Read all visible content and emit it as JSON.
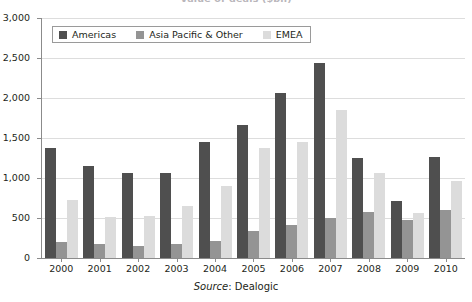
{
  "title": "Value of deals ($bn)",
  "legend": {
    "position": "top-left-inside",
    "items": [
      {
        "label": "Americas",
        "color": "#4f4f4f"
      },
      {
        "label": "Asia Pacific & Other",
        "color": "#949494"
      },
      {
        "label": "EMEA",
        "color": "#dcdcdc"
      }
    ]
  },
  "source": {
    "label": "Source",
    "separator": ":",
    "value": "Dealogic",
    "full": "Source: Dealogic"
  },
  "yaxis": {
    "ticks": [
      "0",
      "500",
      "1,000",
      "1,500",
      "2,000",
      "2,500",
      "3,000"
    ],
    "min": 0,
    "max": 3000,
    "step": 500
  },
  "chart_data": {
    "type": "bar",
    "title": "Value of deals ($bn)",
    "xlabel": "",
    "ylabel": "",
    "ylim": [
      0,
      3000
    ],
    "ytick_step": 500,
    "grid": true,
    "legend_position": "upper left",
    "categories": [
      "2000",
      "2001",
      "2002",
      "2003",
      "2004",
      "2005",
      "2006",
      "2007",
      "2008",
      "2009",
      "2010"
    ],
    "series": [
      {
        "name": "Americas",
        "color": "#4f4f4f",
        "values": [
          1370,
          1150,
          1060,
          1060,
          1450,
          1660,
          2060,
          2440,
          1250,
          710,
          1260
        ]
      },
      {
        "name": "Asia Pacific & Other",
        "color": "#949494",
        "values": [
          200,
          170,
          150,
          180,
          215,
          340,
          410,
          505,
          580,
          480,
          600
        ]
      },
      {
        "name": "EMEA",
        "color": "#dcdcdc",
        "values": [
          730,
          510,
          530,
          650,
          900,
          1380,
          1450,
          1850,
          1060,
          560,
          960
        ]
      }
    ],
    "annotations": [
      "Source: Dealogic"
    ]
  }
}
